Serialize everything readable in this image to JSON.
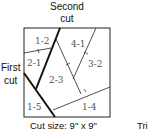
{
  "diagram": {
    "labels": {
      "second_cut_line1": "Second",
      "second_cut_line2": "cut",
      "first_cut_line1": "First",
      "first_cut_line2": "cut",
      "cut_size": "Cut size: 9\" x 9\"",
      "trim_partial": "Tri"
    },
    "pieces": [
      "1-2",
      "2-1",
      "4-1",
      "3-2",
      "2-3",
      "1-5",
      "1-4"
    ],
    "colors": {
      "outline": "#222222",
      "thick_cut": "#111111",
      "piece_text": "#555555"
    }
  }
}
